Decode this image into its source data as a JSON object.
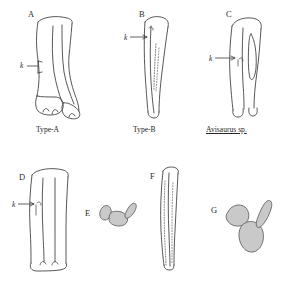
{
  "figure": {
    "type": "scientific-plate",
    "background_color": "#ffffff",
    "outline_color": "#3a3a3a",
    "fill_color": "#c9c9c9",
    "text_color": "#262626"
  },
  "panels": [
    {
      "id": "A",
      "letter": "A",
      "caption": "Type-A",
      "caption_style": "plain",
      "annotation": "k",
      "description": "complete tarsometatarsus, anterior view, splayed distal condyles"
    },
    {
      "id": "B",
      "letter": "B",
      "caption": "Type-B",
      "caption_style": "plain",
      "annotation": "k",
      "description": "slender tarsometatarsus with stippled ridge, anterior view"
    },
    {
      "id": "C",
      "letter": "C",
      "caption": "Avisaurus sp.",
      "caption_style": "italic-underline",
      "annotation": "k",
      "description": "tarsometatarsus with elongate intermetatarsal foramen"
    },
    {
      "id": "D",
      "letter": "D",
      "caption": "",
      "caption_style": "plain",
      "annotation": "k",
      "description": "tarsometatarsus, posterior view"
    },
    {
      "id": "E",
      "letter": "E",
      "caption": "",
      "caption_style": "plain",
      "annotation": "",
      "description": "proximal cross-section, three shaded metatarsal elements"
    },
    {
      "id": "F",
      "letter": "F",
      "caption": "",
      "caption_style": "plain",
      "annotation": "",
      "description": "narrow elongate tarsometatarsus with stippled margin"
    },
    {
      "id": "G",
      "letter": "G",
      "caption": "",
      "caption_style": "plain",
      "annotation": "",
      "description": "proximal cross-section, three large shaded metatarsal elements"
    }
  ]
}
